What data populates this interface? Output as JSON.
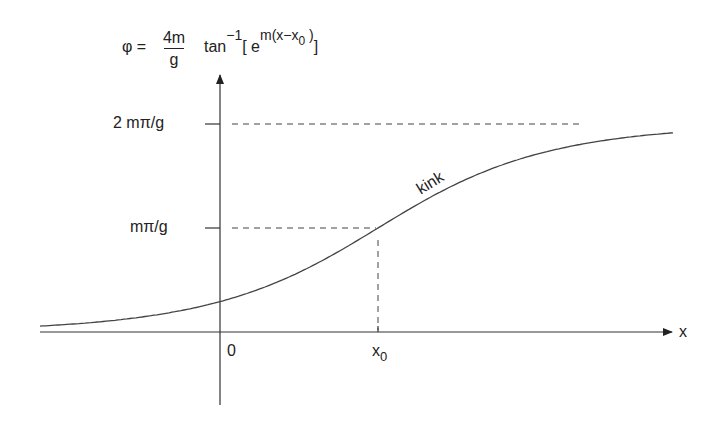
{
  "formula": {
    "lhs": "φ =",
    "numerator": "4m",
    "denominator": "g",
    "func": "tan",
    "func_sup": "−1",
    "open_bracket": "[ e",
    "exp_sup_main": "m(x−x",
    "exp_sup_sub": "0",
    "exp_sup_close": " )",
    "close_bracket": "]"
  },
  "axes": {
    "x_label": "x",
    "origin_label": "0",
    "x0_label_main": "x",
    "x0_label_sub": "0",
    "y_ticks": [
      {
        "label": "2 mπ/g",
        "value": "2mπ/g"
      },
      {
        "label": "mπ/g",
        "value": "mπ/g"
      }
    ]
  },
  "curve_label": "kink",
  "colors": {
    "line": "#444444",
    "axis": "#333333",
    "dash": "#444444"
  },
  "chart_data": {
    "type": "line",
    "xlabel": "x",
    "ylabel": "φ",
    "x_ticks": [
      "0",
      "x0"
    ],
    "y_ticks": [
      "mπ/g",
      "2 mπ/g"
    ],
    "ylim": [
      "0",
      "2mπ/g"
    ],
    "annotations": [
      "kink",
      "dashed guide at φ = mπ/g meeting curve at x = x0",
      "dashed asymptote at φ = 2mπ/g"
    ],
    "series": [
      {
        "name": "kink",
        "description": "sigmoid from φ≈0 (x→−∞) to φ=2mπ/g (x→+∞), passing mπ/g at x0"
      }
    ],
    "grid": false
  }
}
